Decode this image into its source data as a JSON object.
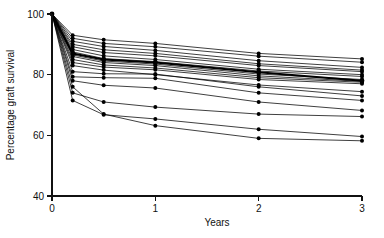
{
  "chart_data": {
    "type": "line",
    "title": "",
    "subtitle": "",
    "xlabel": "Years",
    "ylabel": "Percentage graft survival",
    "xlim": [
      0,
      3
    ],
    "ylim": [
      40,
      100
    ],
    "xticks": [
      0,
      1,
      2,
      3
    ],
    "xtick_labels": [
      "0",
      "1",
      "2",
      "3"
    ],
    "yticks": [
      40,
      60,
      80,
      100
    ],
    "ytick_labels": [
      "40",
      "60",
      "80",
      "100"
    ],
    "grid": false,
    "legend": null,
    "legend_position": "none",
    "markers": "filled-circle",
    "x": [
      0,
      0.2,
      0.5,
      1,
      2,
      3
    ],
    "series": [
      {
        "name": "centre-01",
        "emphasis": "normal",
        "values": [
          100,
          93.0,
          91.5,
          90.3,
          87.0,
          85.2
        ]
      },
      {
        "name": "centre-02",
        "emphasis": "normal",
        "values": [
          100,
          92.0,
          90.3,
          89.2,
          86.1,
          84.1
        ]
      },
      {
        "name": "centre-03",
        "emphasis": "normal",
        "values": [
          100,
          91.0,
          89.3,
          88.0,
          84.6,
          82.4
        ]
      },
      {
        "name": "centre-04",
        "emphasis": "normal",
        "values": [
          100,
          90.0,
          88.2,
          87.0,
          83.6,
          81.5
        ]
      },
      {
        "name": "centre-05",
        "emphasis": "normal",
        "values": [
          100,
          89.2,
          87.3,
          86.2,
          83.0,
          81.0
        ]
      },
      {
        "name": "centre-06",
        "emphasis": "normal",
        "values": [
          100,
          88.3,
          86.2,
          85.0,
          81.8,
          80.0
        ]
      },
      {
        "name": "centre-07",
        "emphasis": "normal",
        "values": [
          100,
          87.5,
          85.3,
          84.3,
          81.2,
          79.4
        ]
      },
      {
        "name": "centre-08",
        "emphasis": "bold",
        "values": [
          100,
          87.0,
          85.0,
          84.0,
          80.8,
          78.0
        ]
      },
      {
        "name": "centre-09",
        "emphasis": "normal",
        "values": [
          100,
          86.5,
          84.5,
          83.5,
          80.2,
          78.4
        ]
      },
      {
        "name": "centre-10",
        "emphasis": "normal",
        "values": [
          100,
          86.0,
          84.0,
          83.0,
          79.6,
          77.8
        ]
      },
      {
        "name": "centre-11",
        "emphasis": "normal",
        "values": [
          100,
          85.0,
          83.2,
          82.2,
          79.0,
          77.5
        ]
      },
      {
        "name": "centre-12",
        "emphasis": "normal",
        "values": [
          100,
          84.0,
          82.5,
          81.6,
          78.4,
          77.0
        ]
      },
      {
        "name": "centre-13",
        "emphasis": "normal",
        "values": [
          100,
          83.0,
          81.5,
          80.0,
          76.6,
          74.4
        ]
      },
      {
        "name": "centre-14",
        "emphasis": "normal",
        "values": [
          100,
          81.0,
          80.3,
          80.2,
          76.0,
          73.0
        ]
      },
      {
        "name": "centre-15",
        "emphasis": "normal",
        "values": [
          100,
          79.3,
          79.0,
          78.8,
          74.0,
          71.5
        ]
      },
      {
        "name": "centre-16",
        "emphasis": "normal",
        "values": [
          100,
          78.0,
          76.5,
          75.6,
          71.0,
          68.2
        ]
      },
      {
        "name": "centre-17",
        "emphasis": "normal",
        "values": [
          100,
          74.0,
          71.0,
          69.3,
          67.0,
          66.2
        ]
      },
      {
        "name": "centre-18",
        "emphasis": "normal",
        "values": [
          100,
          71.5,
          66.8,
          65.4,
          62.0,
          59.6
        ]
      },
      {
        "name": "centre-19",
        "emphasis": "normal",
        "values": [
          100,
          76.0,
          67.0,
          63.2,
          59.0,
          58.2
        ]
      }
    ]
  }
}
